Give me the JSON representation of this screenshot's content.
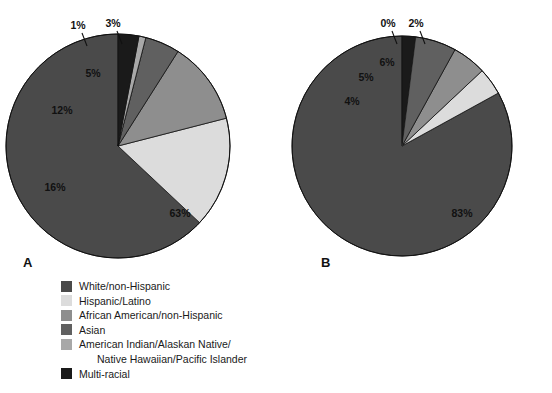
{
  "figure": {
    "background": "#ffffff",
    "width": 552,
    "height": 393
  },
  "palette": {
    "white_non_hispanic": "#4a4a4a",
    "hispanic_latino": "#dcdcdc",
    "african_american": "#8e8e8e",
    "asian": "#606060",
    "american_indian": "#a8a8a8",
    "multi_racial": "#1a1a1a",
    "outline": "#111111",
    "text": "#111111"
  },
  "panel_a": {
    "letter": "A",
    "legend": [
      {
        "label": "White/non-Hispanic",
        "color": "#4a4a4a",
        "second_line": ""
      },
      {
        "label": "Hispanic/Latino",
        "color": "#dcdcdc",
        "second_line": ""
      },
      {
        "label": "African American/non-Hispanic",
        "color": "#8e8e8e",
        "second_line": ""
      },
      {
        "label": "Asian",
        "color": "#606060",
        "second_line": ""
      },
      {
        "label": "American Indian/Alaskan Native/",
        "color": "#a8a8a8",
        "second_line": "Native Hawaiian/Pacific Islander"
      },
      {
        "label": "Multi-racial",
        "color": "#1a1a1a",
        "second_line": ""
      }
    ]
  },
  "panel_b": {
    "letter": "B",
    "legend": [
      {
        "label": "White/non-Hispanic",
        "color": "#4a4a4a",
        "second_line": ""
      },
      {
        "label": "Hispanic/Latino",
        "color": "#dcdcdc",
        "second_line": ""
      },
      {
        "label": "African American/non-Hispanic",
        "color": "#8e8e8e",
        "second_line": ""
      },
      {
        "label": "Asian or native Hawaiian/Pacific Islander",
        "color": "#606060",
        "second_line": ""
      },
      {
        "label": "American Indian/Alaskan Native",
        "color": "#a8a8a8",
        "second_line": ""
      },
      {
        "label": "Multi-racial",
        "color": "#1a1a1a",
        "second_line": ""
      }
    ]
  },
  "chart_data": [
    {
      "type": "pie",
      "title": "A",
      "direction": "counterclockwise",
      "start_angle_deg": 90,
      "center": {
        "x": 118,
        "y": 146
      },
      "radius": 112,
      "labels": [
        "White/non-Hispanic",
        "Hispanic/Latino",
        "African American/non-Hispanic",
        "Asian",
        "American Indian/Alaskan Native/Native Hawaiian/Pacific Islander",
        "Multi-racial"
      ],
      "values": [
        63,
        16,
        12,
        5,
        1,
        3
      ],
      "value_labels": [
        "63%",
        "16%",
        "12%",
        "5%",
        "1%",
        "3%"
      ],
      "colors": [
        "#4a4a4a",
        "#dcdcdc",
        "#8e8e8e",
        "#606060",
        "#a8a8a8",
        "#1a1a1a"
      ],
      "label_positions": [
        {
          "text": "63%",
          "x": 180,
          "y": 208,
          "inside": true,
          "color": "#111111"
        },
        {
          "text": "16%",
          "x": 55,
          "y": 182,
          "inside": true,
          "color": "#111111"
        },
        {
          "text": "12%",
          "x": 62,
          "y": 105,
          "inside": true,
          "color": "#111111"
        },
        {
          "text": "5%",
          "x": 93,
          "y": 68,
          "inside": true,
          "color": "#111111"
        },
        {
          "text": "1%",
          "x": 78,
          "y": 20,
          "inside": false,
          "color": "#111111"
        },
        {
          "text": "3%",
          "x": 113,
          "y": 18,
          "inside": false,
          "color": "#111111"
        }
      ],
      "legend_position": "below"
    },
    {
      "type": "pie",
      "title": "B",
      "direction": "counterclockwise",
      "start_angle_deg": 90,
      "center": {
        "x": 402,
        "y": 146
      },
      "radius": 110,
      "labels": [
        "White/non-Hispanic",
        "Hispanic/Latino",
        "African American/non-Hispanic",
        "Asian or native Hawaiian/Pacific Islander",
        "American Indian/Alaskan Native",
        "Multi-racial"
      ],
      "values": [
        83,
        4,
        5,
        6,
        0,
        2
      ],
      "value_labels": [
        "83%",
        "4%",
        "5%",
        "6%",
        "0%",
        "2%"
      ],
      "colors": [
        "#4a4a4a",
        "#dcdcdc",
        "#8e8e8e",
        "#606060",
        "#a8a8a8",
        "#1a1a1a"
      ],
      "label_positions": [
        {
          "text": "83%",
          "x": 462,
          "y": 208,
          "inside": true,
          "color": "#111111"
        },
        {
          "text": "4%",
          "x": 352,
          "y": 96,
          "inside": true,
          "color": "#111111"
        },
        {
          "text": "5%",
          "x": 366,
          "y": 72,
          "inside": true,
          "color": "#111111"
        },
        {
          "text": "6%",
          "x": 387,
          "y": 57,
          "inside": true,
          "color": "#111111"
        },
        {
          "text": "0%",
          "x": 388,
          "y": 18,
          "inside": false,
          "color": "#111111"
        },
        {
          "text": "2%",
          "x": 416,
          "y": 18,
          "inside": false,
          "color": "#111111"
        }
      ],
      "legend_position": "below"
    }
  ]
}
